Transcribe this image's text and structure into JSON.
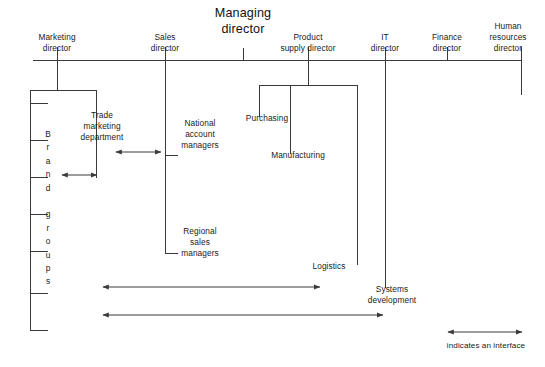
{
  "diagram": {
    "root": {
      "label": "Managing\ndirector",
      "x": 243,
      "y": 6
    },
    "directors": [
      {
        "id": "marketing",
        "label": "Marketing\ndirector",
        "x": 57,
        "y": 32
      },
      {
        "id": "sales",
        "label": "Sales\ndirector",
        "x": 165,
        "y": 32
      },
      {
        "id": "product-supply",
        "label": "Product\nsupply director",
        "x": 308,
        "y": 32
      },
      {
        "id": "it",
        "label": "IT\ndirector",
        "x": 385,
        "y": 32
      },
      {
        "id": "finance",
        "label": "Finance\ndirector",
        "x": 447,
        "y": 32
      },
      {
        "id": "human-resources",
        "label": "Human\nresources\ndirector",
        "x": 508,
        "y": 21
      }
    ],
    "units": [
      {
        "id": "trade-marketing-department",
        "label": "Trade\nmarketing\ndepartment",
        "x": 102,
        "y": 110
      },
      {
        "id": "brand-groups",
        "label": "Brand groups",
        "letters": [
          "B",
          "r",
          "a",
          "n",
          "d",
          "",
          "g",
          "r",
          "o",
          "u",
          "p",
          "s"
        ],
        "x": 48,
        "y": 128
      },
      {
        "id": "national-account-managers",
        "label": "National\naccount\nmanagers",
        "x": 200,
        "y": 118
      },
      {
        "id": "regional-sales-managers",
        "label": "Regional\nsales\nmanagers",
        "x": 200,
        "y": 226
      },
      {
        "id": "purchasing",
        "label": "Purchasing",
        "x": 267,
        "y": 113
      },
      {
        "id": "manufacturing",
        "label": "Manufacturing",
        "x": 298,
        "y": 150
      },
      {
        "id": "logistics",
        "label": "Logistics",
        "x": 329,
        "y": 261
      },
      {
        "id": "systems-development",
        "label": "Systems\ndevelopment",
        "x": 392,
        "y": 284
      }
    ],
    "legend": {
      "label": "indicates an interface",
      "x": 486,
      "y": 340
    },
    "colors": {
      "line": "#3a3a3a",
      "text": "#1a1a1a",
      "background": "#ffffff"
    }
  }
}
